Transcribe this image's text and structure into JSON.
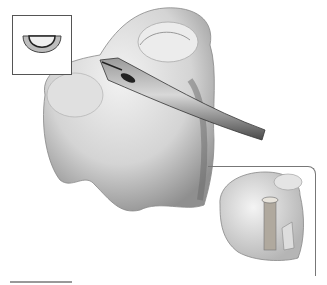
{
  "figure": {
    "main_view": "Knee bone with curved tubular instrument entering joint surface",
    "inset_top_left": "Cross-section of half-pipe (semicircular) instrument tip",
    "inset_bottom_right": "Top view of tibial plateau with cylindrical bone plug / tunnel",
    "scale_bar": true,
    "colors": {
      "background": "#ffffff",
      "bone_light": "#e6e6e6",
      "bone_shadow": "#8a8a8a",
      "instrument": "#6e6e6e",
      "frame": "#555555"
    }
  }
}
